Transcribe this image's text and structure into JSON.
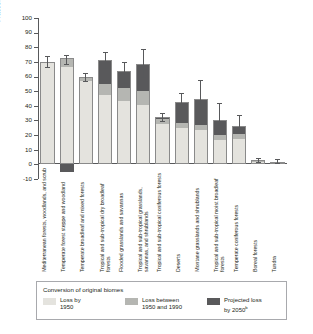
{
  "chart_data": {
    "type": "bar",
    "title": "",
    "xlabel": "",
    "ylabel": "Fraction of potential area converted",
    "ylim": [
      -10,
      100
    ],
    "yticks": [
      -10,
      0,
      10,
      20,
      30,
      40,
      50,
      60,
      70,
      80,
      90,
      100
    ],
    "ytick_labels": [
      "-10",
      "0",
      "10",
      "20",
      "30",
      "40",
      "50",
      "60",
      "70",
      "80",
      "90",
      "100"
    ],
    "grid": false,
    "stacked": true,
    "legend_position": "below",
    "legend_title": "Conversion of original biomes",
    "series": [
      {
        "name": "Loss by 1950",
        "color": "#e4e3de",
        "values": [
          69.5,
          66.5,
          57.0,
          47.5,
          43.0,
          40.5,
          27.5,
          25.0,
          23.5,
          16.5,
          17.0,
          1.5,
          1.0
        ]
      },
      {
        "name": "Loss between 1950 and 1990",
        "color": "#b5b6b2",
        "values": [
          0.5,
          6.0,
          2.0,
          7.5,
          9.0,
          9.5,
          3.5,
          3.0,
          3.5,
          3.5,
          4.0,
          0.8,
          0.5
        ]
      },
      {
        "name": "Projected loss by 2050",
        "color": "#59595b",
        "values": [
          0.0,
          -5.0,
          1.0,
          16.0,
          11.5,
          18.5,
          1.5,
          14.5,
          18.0,
          10.0,
          5.0,
          0.5,
          0.4
        ]
      }
    ],
    "error_bars": [
      {
        "total": 70.0,
        "low": 66.5,
        "high": 74.0
      },
      {
        "total": 72.5,
        "low": 68.5,
        "high": 74.5
      },
      {
        "total": 60.0,
        "low": 57.0,
        "high": 62.5
      },
      {
        "total": 71.0,
        "low": 66.0,
        "high": 77.0
      },
      {
        "total": 63.5,
        "low": 55.5,
        "high": 70.0
      },
      {
        "total": 68.5,
        "low": 60.0,
        "high": 78.5
      },
      {
        "total": 32.5,
        "low": 29.5,
        "high": 35.0
      },
      {
        "total": 42.5,
        "low": 39.0,
        "high": 49.0
      },
      {
        "total": 45.0,
        "low": 41.5,
        "high": 57.5
      },
      {
        "total": 30.0,
        "low": 27.0,
        "high": 42.0
      },
      {
        "total": 26.0,
        "low": 22.5,
        "high": 33.5
      },
      {
        "total": 2.8,
        "low": 1.5,
        "high": 4.5
      },
      {
        "total": 1.9,
        "low": 1.0,
        "high": 3.5
      }
    ],
    "categories": [
      "Mediterranean forests, woodlands, and scrub",
      "Temperate forest steppe and woodland",
      "Temperate broadleaf and mixed forests",
      "Tropical and sub-tropical dry broadleaf forests",
      "Flooded grasslands and savannas",
      "Tropical and sub-tropical grasslands, savannas, and shrublands",
      "Tropical and sub-tropical coniferous forests",
      "Deserts",
      "Montane grasslands and shrublands",
      "Tropical and sub-tropical moist broadleaf forests",
      "Temperate coniferous forests",
      "Boreal forests",
      "Tundra"
    ]
  },
  "legend": {
    "title": "Conversion of original biomes",
    "items": [
      {
        "label_line1": "Loss by",
        "label_line2": "1950",
        "color": "#e4e3de"
      },
      {
        "label_line1": "Loss between",
        "label_line2": "1950 and 1990",
        "color": "#b5b6b2"
      },
      {
        "label_line1": "Projected loss",
        "label_line2": "by 2050",
        "superscript": "b",
        "color": "#59595b"
      }
    ]
  }
}
